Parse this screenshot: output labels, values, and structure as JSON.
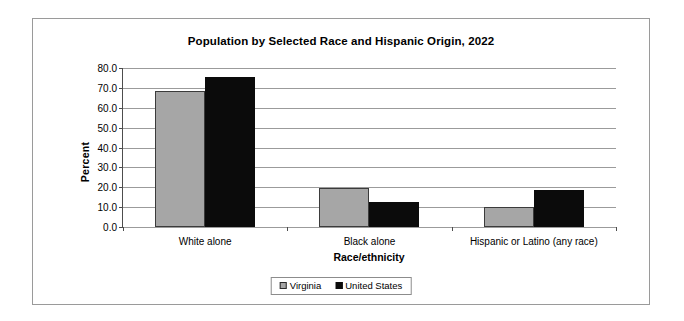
{
  "chart_data": {
    "type": "bar",
    "title": "Population by Selected Race and Hispanic Origin, 2022",
    "xlabel": "Race/ethnicity",
    "ylabel": "Percent",
    "categories": [
      "White alone",
      "Black alone",
      "Hispanic or Latino (any race)"
    ],
    "series": [
      {
        "name": "Virginia",
        "color": "#a6a6a6",
        "values": [
          68.5,
          19.6,
          10.1
        ]
      },
      {
        "name": "United States",
        "color": "#0b0b0b",
        "values": [
          75.5,
          12.6,
          18.7
        ]
      }
    ],
    "ylim": [
      0.0,
      80.0
    ],
    "ytick_labels": [
      "80.0",
      "70.0",
      "60.0",
      "50.0",
      "40.0",
      "30.0",
      "20.0",
      "10.0",
      "0.0"
    ],
    "ytick_values": [
      80.0,
      70.0,
      60.0,
      50.0,
      40.0,
      30.0,
      20.0,
      10.0,
      0.0
    ],
    "grid": true,
    "legend_position": "bottom"
  }
}
